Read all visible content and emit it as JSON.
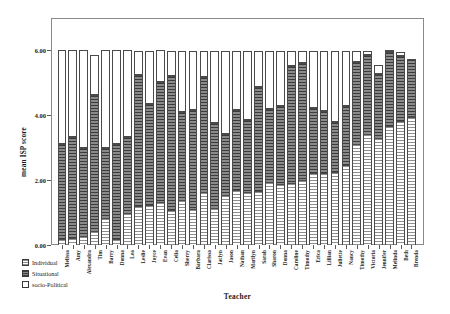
{
  "chart_data": {
    "type": "bar",
    "subtype": "stacked-bar",
    "title": "",
    "xlabel": "Teacher",
    "ylabel": "mean ISP score",
    "ylim": [
      0.0,
      7.0
    ],
    "yticks": [
      "0.00",
      "2.00",
      "4.00",
      "6.00"
    ],
    "ytick_values": [
      0.0,
      2.0,
      4.0,
      6.0
    ],
    "grid": false,
    "legend_position": "bottom-left",
    "categories": [
      "Melissa",
      "Amy",
      "Alexandra",
      "Tim",
      "Barry",
      "Donna",
      "Lea",
      "Leslie",
      "Joyce",
      "Evan",
      "Celia",
      "Sherry",
      "Barbara",
      "Clarissa",
      "Jaclyn",
      "Jason",
      "Nathan",
      "Marilyn",
      "Sarah",
      "Sharon",
      "Donna",
      "Caroline",
      "Timothy",
      "Erica",
      "Lillian",
      "Juliette",
      "Nancy",
      "Timothy",
      "Victoria",
      "Jennifer",
      "Melinda",
      "Beth",
      "Brenda"
    ],
    "series": [
      {
        "name": "Individual",
        "color": "#ffffff",
        "pattern": "horizontal-lines",
        "values": [
          0.18,
          0.22,
          0.28,
          0.42,
          0.82,
          0.18,
          0.98,
          1.2,
          1.24,
          1.32,
          1.08,
          1.4,
          1.1,
          1.62,
          1.14,
          1.55,
          1.7,
          1.62,
          1.68,
          1.95,
          1.88,
          1.92,
          2.02,
          2.22,
          2.22,
          2.25,
          2.48,
          3.12,
          3.42,
          3.3,
          3.68,
          3.82,
          3.95
        ]
      },
      {
        "name": "Situational",
        "color": "#6e6e6e",
        "pattern": "dark-horizontal-lines",
        "values": [
          2.92,
          3.1,
          2.72,
          4.22,
          2.18,
          2.92,
          2.36,
          4.05,
          3.12,
          3.7,
          4.12,
          2.7,
          3.06,
          3.55,
          2.62,
          1.88,
          2.45,
          2.22,
          3.18,
          2.25,
          2.4,
          3.6,
          3.58,
          2.02,
          1.9,
          1.55,
          1.82,
          2.52,
          2.44,
          1.98,
          2.28,
          2.02,
          1.78
        ]
      },
      {
        "name": "socio-Political",
        "color": "#ffffff",
        "pattern": "solid",
        "values": [
          2.9,
          2.68,
          3.0,
          1.22,
          3.0,
          2.9,
          2.66,
          0.73,
          1.62,
          0.98,
          0.78,
          1.88,
          1.82,
          0.81,
          2.22,
          2.55,
          1.83,
          2.14,
          1.12,
          1.78,
          1.7,
          0.46,
          0.38,
          1.74,
          1.86,
          2.18,
          1.68,
          0.34,
          0.12,
          0.28,
          0.02,
          0.12,
          0.0
        ]
      }
    ],
    "totals": [
      6.0,
      6.0,
      6.0,
      5.86,
      6.0,
      6.0,
      6.0,
      5.98,
      5.98,
      6.0,
      5.98,
      5.98,
      5.98,
      5.98,
      5.98,
      5.98,
      5.98,
      5.98,
      5.98,
      5.98,
      5.98,
      5.98,
      5.98,
      5.98,
      5.98,
      5.98,
      5.98,
      5.98,
      5.98,
      5.56,
      5.98,
      5.96,
      5.73
    ]
  },
  "legend": {
    "items": [
      {
        "label": "Individual",
        "swatch": "individual"
      },
      {
        "label": "Situational",
        "swatch": "situational"
      },
      {
        "label": "socio-Political",
        "swatch": "sociopolitical"
      }
    ]
  }
}
